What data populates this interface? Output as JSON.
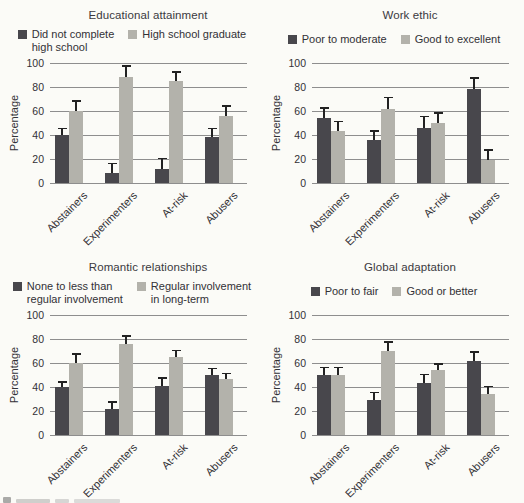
{
  "figure": {
    "y_axis_label": "Percentage",
    "y_ticks": [
      "0",
      "20",
      "40",
      "60",
      "80",
      "100"
    ],
    "categories": [
      "Abstainers",
      "Experimenters",
      "At-risk",
      "Abusers"
    ],
    "colors": {
      "series1": "#48474c",
      "series2": "#b3b2ab",
      "grid": "#8e8e8e",
      "error_bar": "#222222",
      "text": "#323136",
      "background": "#fbfbf7"
    }
  },
  "chart_data": [
    {
      "type": "bar",
      "title": "Educational attainment",
      "ylabel": "Percentage",
      "ylim": [
        0,
        100
      ],
      "grid": true,
      "legend_position": "top",
      "categories": [
        "Abstainers",
        "Experimenters",
        "At-risk",
        "Abusers"
      ],
      "series": [
        {
          "name": "Did not complete\nhigh school",
          "values": [
            40,
            8,
            12,
            38
          ],
          "errors": [
            6,
            9,
            9,
            8
          ]
        },
        {
          "name": "High school graduate",
          "values": [
            60,
            88,
            85,
            56
          ],
          "errors": [
            9,
            10,
            8,
            9
          ]
        }
      ]
    },
    {
      "type": "bar",
      "title": "Work ethic",
      "ylabel": "Percentage",
      "ylim": [
        0,
        100
      ],
      "grid": true,
      "legend_position": "top",
      "categories": [
        "Abstainers",
        "Experimenters",
        "At-risk",
        "Abusers"
      ],
      "series": [
        {
          "name": "Poor to moderate",
          "values": [
            54,
            36,
            46,
            78
          ],
          "errors": [
            9,
            8,
            10,
            10
          ]
        },
        {
          "name": "Good to excellent",
          "values": [
            43,
            62,
            50,
            19
          ],
          "errors": [
            9,
            10,
            9,
            9
          ]
        }
      ]
    },
    {
      "type": "bar",
      "title": "Romantic relationships",
      "ylabel": "Percentage",
      "ylim": [
        0,
        100
      ],
      "grid": true,
      "legend_position": "top",
      "categories": [
        "Abstainers",
        "Experimenters",
        "At-risk",
        "Abusers"
      ],
      "series": [
        {
          "name": "None to less than\nregular involvement",
          "values": [
            40,
            22,
            41,
            50
          ],
          "errors": [
            5,
            6,
            7,
            6
          ]
        },
        {
          "name": "Regular involvement\nin long-term",
          "values": [
            60,
            76,
            65,
            47
          ],
          "errors": [
            8,
            7,
            6,
            5
          ]
        }
      ]
    },
    {
      "type": "bar",
      "title": "Global adaptation",
      "ylabel": "Percentage",
      "ylim": [
        0,
        100
      ],
      "grid": true,
      "legend_position": "top",
      "categories": [
        "Abstainers",
        "Experimenters",
        "At-risk",
        "Abusers"
      ],
      "series": [
        {
          "name": "Poor to fair",
          "values": [
            50,
            29,
            43,
            62
          ],
          "errors": [
            7,
            7,
            8,
            8
          ]
        },
        {
          "name": "Good or better",
          "values": [
            50,
            70,
            54,
            34
          ],
          "errors": [
            7,
            8,
            6,
            7
          ]
        }
      ]
    }
  ]
}
